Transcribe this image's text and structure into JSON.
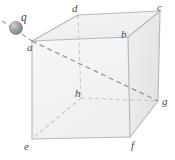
{
  "figure": {
    "type": "geometry-diagram",
    "colors": {
      "edge_solid": "#b9bcbf",
      "edge_dashed": "#c3c6c9",
      "face_fill_front": "#f2f3f4",
      "face_fill_top": "#eceef0",
      "face_fill_right": "#e6e8ea",
      "label_text": "#4a4a4a",
      "charge_sphere": "#9a9a9a",
      "charge_sphere_highlight": "#c9c9c9",
      "background": "#ffffff"
    }
  },
  "labels": {
    "a": "a",
    "b": "b",
    "c": "c",
    "d": "d",
    "e": "e",
    "f": "f",
    "g": "g",
    "h": "h",
    "q": "q"
  },
  "label_positions": {
    "a": {
      "x": 27,
      "y": 42
    },
    "b": {
      "x": 121,
      "y": 29
    },
    "c": {
      "x": 157,
      "y": 2
    },
    "d": {
      "x": 72,
      "y": 3
    },
    "e": {
      "x": 24,
      "y": 141
    },
    "f": {
      "x": 131,
      "y": 140
    },
    "g": {
      "x": 162,
      "y": 96
    },
    "h": {
      "x": 75,
      "y": 88
    },
    "q": {
      "x": 21,
      "y": 12
    }
  },
  "vertices": {
    "a": {
      "x": 32,
      "y": 41
    },
    "b": {
      "x": 128,
      "y": 37
    },
    "c": {
      "x": 160,
      "y": 11
    },
    "d": {
      "x": 78,
      "y": 15
    },
    "e": {
      "x": 32,
      "y": 139
    },
    "f": {
      "x": 130,
      "y": 137
    },
    "g": {
      "x": 158,
      "y": 101
    },
    "h": {
      "x": 81,
      "y": 98
    }
  },
  "charge": {
    "label": "q",
    "center": {
      "x": 16,
      "y": 28
    },
    "radius": 6.5
  },
  "edges": {
    "solid": [
      [
        "a",
        "b"
      ],
      [
        "b",
        "c"
      ],
      [
        "c",
        "d"
      ],
      [
        "d",
        "a"
      ],
      [
        "a",
        "e"
      ],
      [
        "b",
        "f"
      ],
      [
        "c",
        "g"
      ],
      [
        "e",
        "f"
      ],
      [
        "f",
        "g"
      ]
    ],
    "dashed": [
      [
        "d",
        "h"
      ],
      [
        "h",
        "g"
      ],
      [
        "h",
        "e"
      ]
    ]
  },
  "diagonals": {
    "dashed": [
      [
        "a",
        "g"
      ]
    ]
  },
  "charge_ray": {
    "dashed": true,
    "from": {
      "x": 2,
      "y": 21
    },
    "to": {
      "x": 32,
      "y": 41
    }
  }
}
